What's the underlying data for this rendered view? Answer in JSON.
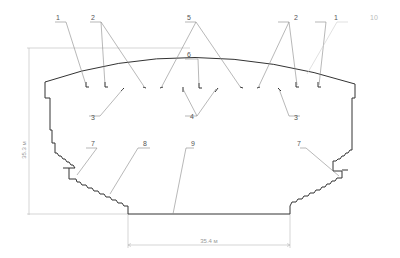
{
  "diagram": {
    "type": "cross-section",
    "dimensions": {
      "height_label": "35.3 м",
      "width_label": "35.4 м"
    },
    "callouts": [
      {
        "id": "callout-1-left",
        "text": "1"
      },
      {
        "id": "callout-2-left",
        "text": "2"
      },
      {
        "id": "callout-5",
        "text": "5"
      },
      {
        "id": "callout-2-right",
        "text": "2"
      },
      {
        "id": "callout-1-right",
        "text": "1"
      },
      {
        "id": "callout-10",
        "text": "10"
      },
      {
        "id": "callout-6",
        "text": "6"
      },
      {
        "id": "callout-3-left",
        "text": "3"
      },
      {
        "id": "callout-4",
        "text": "4"
      },
      {
        "id": "callout-3-right",
        "text": "3"
      },
      {
        "id": "callout-7-left",
        "text": "7"
      },
      {
        "id": "callout-8",
        "text": "8"
      },
      {
        "id": "callout-9",
        "text": "9"
      },
      {
        "id": "callout-7-right",
        "text": "7"
      }
    ]
  }
}
